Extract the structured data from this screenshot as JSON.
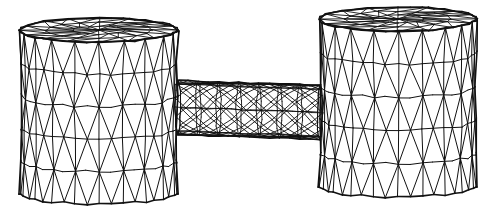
{
  "figure": {
    "title": "Finite element mesh of a dumbbell (dogbone) specimen",
    "type": "3d-wireframe-mesh",
    "background_color": "#ffffff",
    "line_color": "#111111",
    "canvas": {
      "width": 497,
      "height": 214
    },
    "view": {
      "projection": "perspective-like-oblique",
      "camera_elevation_note": "viewed slightly from above, top caps seen nearly edge-on",
      "cap_ellipse_ratio": 0.155
    },
    "components": [
      {
        "name": "left-cylinder",
        "role": "end-grip",
        "center_x": 99,
        "top_y": 30,
        "bottom_y": 193,
        "radius_x": 79,
        "radius_y": 12,
        "circumferential_segments": 20,
        "height_rings": 5,
        "cap_rings": 3,
        "cap_sectors": 16,
        "bulge": 5
      },
      {
        "name": "neck",
        "role": "gauge-section",
        "left_x": 178,
        "right_x": 320,
        "center_y": 110,
        "radius_x": 143,
        "radius_y": 27,
        "cap_ellipse_x": 7,
        "circumferential_segments": 18,
        "axial_segments": 14
      },
      {
        "name": "right-cylinder",
        "role": "end-grip",
        "center_x": 398,
        "top_y": 19,
        "bottom_y": 186,
        "radius_x": 79,
        "radius_y": 12,
        "circumferential_segments": 20,
        "height_rings": 5,
        "cap_rings": 3,
        "cap_sectors": 16,
        "bulge": 5
      }
    ],
    "stroke_widths": {
      "silhouette": 1.6,
      "ring": 1.0,
      "diagonal": 1.0,
      "neck": 0.9,
      "cap": 0.9
    }
  }
}
